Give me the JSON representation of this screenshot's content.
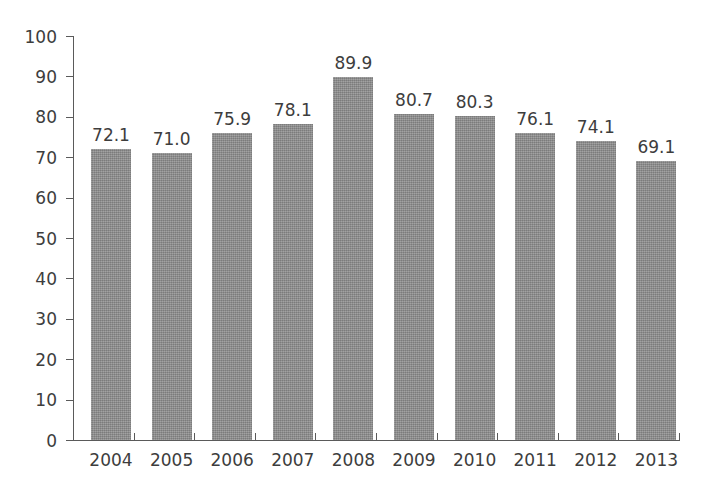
{
  "chart_data": {
    "type": "bar",
    "title": "",
    "subtitle": "",
    "xlabel": "",
    "ylabel": "",
    "categories": [
      "2004",
      "2005",
      "2006",
      "2007",
      "2008",
      "2009",
      "2010",
      "2011",
      "2012",
      "2013"
    ],
    "values": [
      72.1,
      71.0,
      75.9,
      78.1,
      89.9,
      80.7,
      80.3,
      76.1,
      74.1,
      69.1
    ],
    "value_labels": [
      "72.1",
      "71.0",
      "75.9",
      "78.1",
      "89.9",
      "80.7",
      "80.3",
      "76.1",
      "74.1",
      "69.1"
    ],
    "ylim": [
      0,
      100
    ],
    "ytick_labels": [
      "0",
      "10",
      "20",
      "30",
      "40",
      "50",
      "60",
      "70",
      "80",
      "90",
      "100"
    ],
    "ytick_values": [
      0,
      10,
      20,
      30,
      40,
      50,
      60,
      70,
      80,
      90,
      100
    ],
    "grid": false,
    "legend": null,
    "legend_position": "none",
    "series": [
      {
        "name": "",
        "values": [
          72.1,
          71.0,
          75.9,
          78.1,
          89.9,
          80.7,
          80.3,
          76.1,
          74.1,
          69.1
        ],
        "color": "#8d8d8d"
      }
    ],
    "annotations": []
  },
  "style": {
    "background": "#ffffff",
    "bar_color": "#8d8d8d",
    "axis_color": "#5a5a5a",
    "text_color": "#3d3d3d"
  }
}
